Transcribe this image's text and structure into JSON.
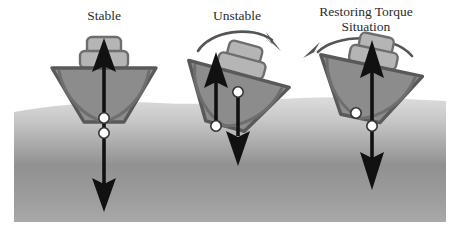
{
  "figure": {
    "background_color": "#ffffff",
    "water": {
      "name": "water-surface",
      "top_color": "#d8d8d8",
      "mid_color": "#8f8f8f",
      "bottom_color": "#a8a8a8",
      "left": 14,
      "right": 446,
      "top": 100,
      "bottom": 222
    },
    "palette": {
      "hull_fill": "#8c8c8c",
      "hull_stroke": "#595959",
      "cabin_fill": "#b5b5b5",
      "cabin_stroke": "#6e6e6e",
      "vector_color": "#111111",
      "dot_fill": "#ffffff",
      "dot_stroke": "#333333",
      "torque_arrow_color": "#555555",
      "label_color": "#2b2b2b"
    }
  },
  "panels": [
    {
      "id": "stable",
      "label": "Stable",
      "label_lines": [
        "Stable"
      ],
      "tilt_deg": 0,
      "torque_arrow": "none",
      "description": "Upright hull; center of gravity directly above center of buoyancy; buoyancy vector up, weight vector down, no net torque.",
      "vectors": [
        {
          "name": "buoyancy-vector",
          "direction": "up",
          "label": ""
        },
        {
          "name": "weight-vector",
          "direction": "down",
          "label": ""
        }
      ],
      "points": [
        {
          "name": "center-of-gravity-dot",
          "order": "upper"
        },
        {
          "name": "center-of-buoyancy-dot",
          "order": "lower"
        }
      ]
    },
    {
      "id": "unstable",
      "label": "Unstable",
      "label_lines": [
        "Unstable"
      ],
      "tilt_deg": 15,
      "torque_arrow": "clockwise",
      "description": "Heeled hull; center of buoyancy lies inboard of the center of gravity so the couple rotates the vessel further over and it capsizes.",
      "vectors": [
        {
          "name": "buoyancy-vector",
          "direction": "up",
          "label": ""
        },
        {
          "name": "weight-vector",
          "direction": "down",
          "label": ""
        }
      ],
      "points": [
        {
          "name": "center-of-gravity-dot",
          "order": "upper-right"
        },
        {
          "name": "center-of-buoyancy-dot",
          "order": "lower-left"
        }
      ]
    },
    {
      "id": "restoring",
      "label": "Restoring Torque Situation",
      "label_lines": [
        "Restoring Torque",
        "Situation"
      ],
      "tilt_deg": 12,
      "torque_arrow": "counter-clockwise",
      "description": "Heeled hull; center of buoyancy shifts outboard of the center of gravity producing a couple that rights the vessel.",
      "vectors": [
        {
          "name": "buoyancy-vector",
          "direction": "up",
          "label": ""
        },
        {
          "name": "weight-vector",
          "direction": "down",
          "label": ""
        }
      ],
      "points": [
        {
          "name": "center-of-gravity-dot",
          "order": "left"
        },
        {
          "name": "center-of-buoyancy-dot",
          "order": "right"
        }
      ]
    }
  ]
}
